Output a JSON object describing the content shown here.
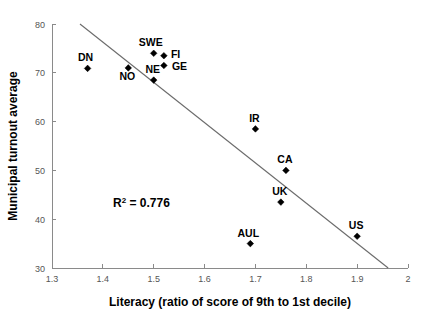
{
  "chart_data": {
    "type": "scatter",
    "title": "",
    "xlabel": "Literacy (ratio of score of 9th to 1st decile)",
    "ylabel": "Municipal turnout average",
    "xlim": [
      1.3,
      2.0
    ],
    "ylim": [
      30,
      80
    ],
    "xticks": [
      "1.3",
      "1.4",
      "1.5",
      "1.6",
      "1.7",
      "1.8",
      "1.9",
      "2"
    ],
    "xtick_values": [
      1.3,
      1.4,
      1.5,
      1.6,
      1.7,
      1.8,
      1.9,
      2.0
    ],
    "yticks": [
      "30",
      "40",
      "50",
      "60",
      "70",
      "80"
    ],
    "ytick_values": [
      30,
      40,
      50,
      60,
      70,
      80
    ],
    "grid": false,
    "legend": "none",
    "marker_style": "diamond",
    "marker_color": "#000000",
    "points": [
      {
        "label": "DN",
        "x": 1.37,
        "y": 70.9,
        "label_dx": -2,
        "label_dy": -7
      },
      {
        "label": "NO",
        "x": 1.45,
        "y": 71.0,
        "label_dx": -1,
        "label_dy": 12
      },
      {
        "label": "NE",
        "x": 1.5,
        "y": 68.5,
        "label_dx": -1,
        "label_dy": -7
      },
      {
        "label": "SWE",
        "x": 1.5,
        "y": 74.0,
        "label_dx": -3,
        "label_dy": -7
      },
      {
        "label": "FI",
        "x": 1.52,
        "y": 73.5,
        "label_dx": 7,
        "label_dy": 2
      },
      {
        "label": "GE",
        "x": 1.52,
        "y": 71.5,
        "label_dx": 8,
        "label_dy": 5
      },
      {
        "label": "IR",
        "x": 1.7,
        "y": 58.5,
        "label_dx": -1,
        "label_dy": -7
      },
      {
        "label": "CA",
        "x": 1.76,
        "y": 50.0,
        "label_dx": -1,
        "label_dy": -7
      },
      {
        "label": "UK",
        "x": 1.75,
        "y": 43.5,
        "label_dx": -1,
        "label_dy": -7
      },
      {
        "label": "AUL",
        "x": 1.69,
        "y": 35.0,
        "label_dx": -2,
        "label_dy": -7
      },
      {
        "label": "US",
        "x": 1.9,
        "y": 36.5,
        "label_dx": -1,
        "label_dy": -7
      }
    ],
    "trendline": {
      "x_start": 1.355,
      "y_start": 80.0,
      "x_end": 1.961,
      "y_end": 30.0
    },
    "annotations": [
      {
        "name": "r-squared",
        "prefix": "R",
        "superscript": "2",
        "suffix": " = 0.776",
        "x": 1.42,
        "y": 42.5
      }
    ]
  },
  "annotation": {
    "r2_prefix": "R",
    "r2_sup": "2",
    "r2_suffix": " = 0.776"
  }
}
